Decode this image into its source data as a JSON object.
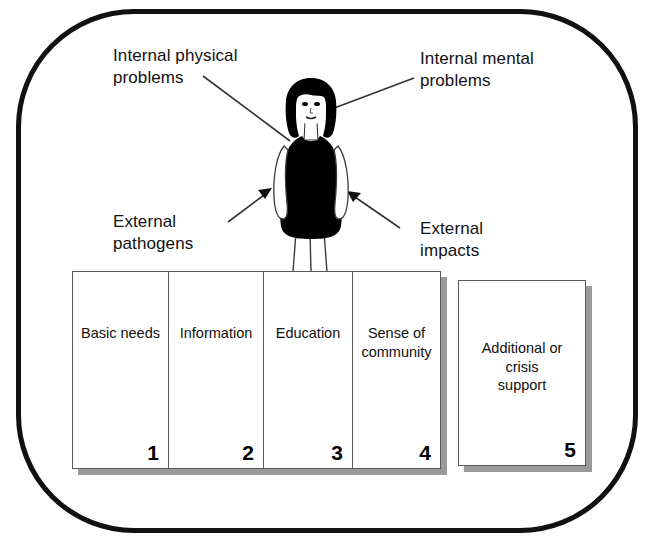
{
  "diagram": {
    "frame": {
      "shape": "rounded-rectangle",
      "stroke_color": "#111111"
    },
    "figure": {
      "name": "standing-person",
      "description": "Stylised standing woman with dark bob hair, white face, black sleeveless dress, white arms and legs",
      "hair_color": "#000000",
      "dress_color": "#000000",
      "skin_color": "#ffffff"
    },
    "annotations": [
      {
        "id": "internal-physical",
        "text": "Internal physical\nproblems",
        "position": "top-left",
        "connector": "line",
        "points_to": "figure-left-shoulder"
      },
      {
        "id": "internal-mental",
        "text": "Internal mental\nproblems",
        "position": "top-right",
        "connector": "line",
        "points_to": "figure-head"
      },
      {
        "id": "external-pathogens",
        "text": "External\npathogens",
        "position": "middle-left",
        "connector": "arrow",
        "points_to": "figure-left-hip"
      },
      {
        "id": "external-impacts",
        "text": "External\nimpacts",
        "position": "middle-right",
        "connector": "arrow",
        "points_to": "figure-right-hip"
      }
    ],
    "cards": {
      "primary_group": [
        {
          "label": "Basic needs",
          "number": "1"
        },
        {
          "label": "Information",
          "number": "2"
        },
        {
          "label": "Education",
          "number": "3"
        },
        {
          "label": "Sense of\ncommunity",
          "number": "4"
        }
      ],
      "secondary_group": [
        {
          "label": "Additional or\ncrisis\nsupport",
          "number": "5"
        }
      ]
    }
  }
}
